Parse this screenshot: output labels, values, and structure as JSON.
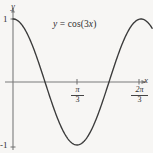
{
  "figure": {
    "background_color": "#f7f6f4",
    "curve_color": "#3a3a3a",
    "axis_color": "#777777",
    "equation_label": "y = cos(3x)",
    "equation_lhs": "y",
    "equation_eq": " = ",
    "equation_rhs_fn": "cos(3",
    "equation_rhs_var": "x",
    "equation_rhs_close": ")"
  },
  "axes": {
    "y_axis_name": "y",
    "x_axis_name": "x",
    "y_ticks": [
      {
        "label": "1",
        "value": 1
      },
      {
        "label": "-1",
        "value": -1
      }
    ],
    "x_ticks": [
      {
        "numerator": "π",
        "denominator": "3",
        "label": "π/3",
        "value": 1.0471975512
      },
      {
        "numerator": "2π",
        "denominator": "3",
        "label": "2π/3",
        "value": 2.0943951024
      }
    ]
  },
  "chart_data": {
    "type": "line",
    "title": "",
    "subtitle": "",
    "annotations": [
      "y = cos(3x)"
    ],
    "xlabel": "x",
    "ylabel": "y",
    "xlim": [
      0,
      2.2776547
    ],
    "ylim": [
      -1,
      1
    ],
    "grid": false,
    "legend": "none",
    "xtick_values": [
      1.0471975512,
      2.0943951024
    ],
    "xtick_labels": [
      "π/3",
      "2π/3"
    ],
    "ytick_values": [
      1,
      -1
    ],
    "ytick_labels": [
      "1",
      "-1"
    ],
    "series": [
      {
        "name": "y = cos(3x)",
        "expression": "cos(3*x)",
        "color": "#3a3a3a",
        "x": [
          0.0,
          0.11388,
          0.22777,
          0.34165,
          0.45553,
          0.56941,
          0.6833,
          0.79718,
          0.91106,
          1.02494,
          1.13883,
          1.25271,
          1.36659,
          1.48048,
          1.59436,
          1.70824,
          1.82212,
          1.93601,
          2.04989,
          2.16377,
          2.27765
        ],
        "y": [
          1.0,
          0.9435,
          0.7818,
          0.5358,
          0.2334,
          -0.0941,
          -0.4129,
          -0.6895,
          -0.8952,
          -0.9911,
          -0.9843,
          -0.8763,
          -0.6691,
          -0.4067,
          -0.1045,
          0.2045,
          0.4818,
          0.729,
          0.9048,
          0.9921,
          0.9823
        ]
      }
    ],
    "zero_crossings": [
      0.5235987756,
      1.5707963268
    ],
    "minimum": {
      "x": 1.0471975512,
      "y": -1
    }
  }
}
